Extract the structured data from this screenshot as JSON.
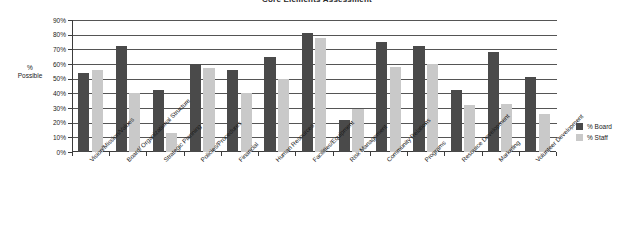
{
  "chart_data": {
    "type": "bar",
    "title": "Core Elements Assessment",
    "xlabel": "",
    "ylabel": "%\nPossible",
    "ylabel_lines": [
      "%",
      "Possible"
    ],
    "ylim": [
      0,
      90
    ],
    "ytick_step": 10,
    "ytick_labels": [
      "90%",
      "80%",
      "70%",
      "60%",
      "50%",
      "40%",
      "30%",
      "20%",
      "10%",
      "0%"
    ],
    "grid": true,
    "legend_position": "right",
    "categories": [
      "Vision/Mission/Values",
      "Board/ Organizational Structure",
      "Strategic Planning",
      "Policies/Procedures",
      "Financial",
      "Human Resources",
      "Facilities/Equipment",
      "Risk Management",
      "Community Relations",
      "Programs",
      "Resource Development",
      "Marketing",
      "Volunteer Development"
    ],
    "series": [
      {
        "name": "% Board",
        "color": "#4a4a4a",
        "values": [
          54,
          72,
          42,
          60,
          56,
          65,
          81,
          22,
          75,
          72,
          42,
          68,
          51
        ]
      },
      {
        "name": "% Staff",
        "color": "#c9c9c9",
        "values": [
          56,
          40,
          13,
          57,
          40,
          50,
          78,
          29,
          58,
          60,
          32,
          33,
          26
        ]
      }
    ]
  },
  "legend": {
    "items": [
      {
        "label": "% Board",
        "swatch": "board"
      },
      {
        "label": "% Staff",
        "swatch": "staff"
      }
    ]
  }
}
